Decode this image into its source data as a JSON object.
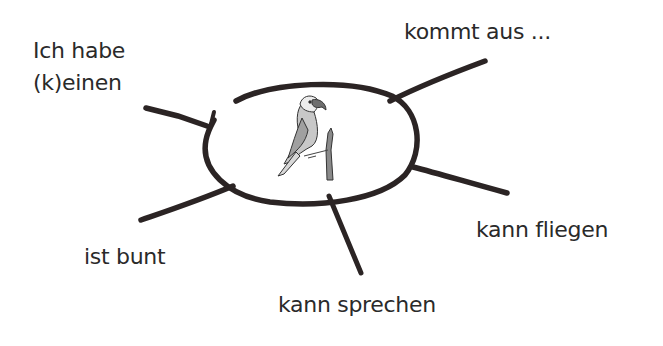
{
  "diagram": {
    "type": "mind-map",
    "center": {
      "image": "parrot-on-branch",
      "label": ""
    },
    "branches": [
      {
        "id": "top-left",
        "text_line1": "Ich habe",
        "text_line2": "(k)einen"
      },
      {
        "id": "top-right",
        "text": "kommt aus ..."
      },
      {
        "id": "right",
        "text": "kann fliegen"
      },
      {
        "id": "bottom",
        "text": "kann sprechen"
      },
      {
        "id": "bottom-left",
        "text": "ist bunt"
      }
    ],
    "colors": {
      "stroke": "#2b2424",
      "text": "#2a2a2a",
      "background": "#ffffff",
      "parrot_shade": "#9a9a9a"
    }
  }
}
